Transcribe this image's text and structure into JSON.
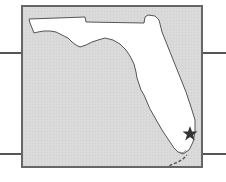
{
  "map": {
    "region": "Florida",
    "marker": {
      "type": "star",
      "location_label": "",
      "color": "#333333"
    },
    "colors": {
      "water": "#d9d9d9",
      "land": "#ffffff",
      "border": "#666666",
      "coast": "#555555"
    }
  },
  "connector_lines": [
    {
      "side": "left",
      "y": 53
    },
    {
      "side": "left",
      "y": 154
    },
    {
      "side": "right",
      "y": 53
    },
    {
      "side": "right",
      "y": 154
    }
  ]
}
